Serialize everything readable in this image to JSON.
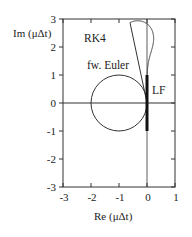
{
  "chart_data": {
    "type": "line",
    "title": "",
    "xlabel": "Re (μΔt)",
    "ylabel": "Im (μΔt)",
    "xlim": [
      -3,
      1
    ],
    "ylim": [
      -3,
      3
    ],
    "xticks": [
      -3,
      -2,
      -1,
      0,
      1
    ],
    "yticks": [
      -3,
      -2,
      -1,
      0,
      1,
      2,
      3
    ],
    "grid": false,
    "legend": "inline labels",
    "series": [
      {
        "name": "RK4",
        "kind": "stability-boundary",
        "equation": "|1+z+z^2/2+z^3/6+z^4/24| = 1",
        "approx_extent": {
          "re_min": -2.79,
          "re_max": 0.03,
          "im_min": -2.83,
          "im_max": 2.83
        }
      },
      {
        "name": "fw. Euler",
        "kind": "circle",
        "center": [
          -1,
          0
        ],
        "radius": 1
      },
      {
        "name": "LF",
        "kind": "segment",
        "from": [
          0,
          -1
        ],
        "to": [
          0,
          1
        ],
        "bold": true
      }
    ],
    "annotations": [
      {
        "text": "RK4",
        "x": -1.85,
        "y": 2.1
      },
      {
        "text": "fw. Euler",
        "x": -1.85,
        "y": 1.2
      },
      {
        "text": "LF",
        "x": 0.15,
        "y": 0.5
      }
    ]
  },
  "labels": {
    "xlabel": "Re (μΔt)",
    "ylabel": "Im (μΔt)",
    "rk4": "RK4",
    "euler": "fw. Euler",
    "lf": "LF",
    "xticks": [
      "-3",
      "-2",
      "-1",
      "0",
      "1"
    ],
    "yticks": [
      "3",
      "2",
      "1",
      "0",
      "-1",
      "-2",
      "-3"
    ]
  }
}
